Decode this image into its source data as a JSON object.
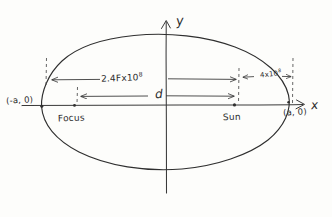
{
  "figure": {
    "type": "hand-drawn-geometry-sketch",
    "ink_color": "#333333",
    "paper_color": "#fdfdfb"
  },
  "axes": {
    "y_label": "y",
    "x_label": "x",
    "origin_x": 166,
    "origin_y": 105
  },
  "ellipse": {
    "center_x": 166,
    "center_y": 105,
    "semi_major_px": 126,
    "semi_minor_px": 72
  },
  "labels": {
    "left_vertex": "(-a, 0)",
    "right_vertex": "(a, 0)",
    "focus": "Focus",
    "sun": "Sun",
    "distance_d": "d",
    "major_distance_mantissa": "2.4",
    "major_distance_text": "2.4Fx10",
    "major_distance_exponent": "8",
    "minor_distance_text": "4x10",
    "minor_distance_exponent": "8"
  },
  "points": [
    {
      "name": "focus",
      "x": 74,
      "y": 105
    },
    {
      "name": "sun",
      "x": 234,
      "y": 105
    },
    {
      "name": "left-vertex",
      "x": 41,
      "y": 105
    },
    {
      "name": "right-vertex",
      "x": 289,
      "y": 105
    }
  ],
  "dimension_arrows": [
    {
      "name": "major-span",
      "label": "2.4Fx10^8",
      "from_x": 46,
      "to_x": 243,
      "y": 79
    },
    {
      "name": "minor-span",
      "label": "4x10^8",
      "from_x": 243,
      "to_x": 293,
      "y": 79
    },
    {
      "name": "d-span",
      "label": "d",
      "from_x": 77,
      "to_x": 238,
      "y": 96
    }
  ],
  "dashed_guides": [
    {
      "name": "guide-left-outer",
      "x": 46,
      "top": 58,
      "bottom": 86
    },
    {
      "name": "guide-focus",
      "x": 77,
      "top": 88,
      "bottom": 103
    },
    {
      "name": "guide-sun",
      "x": 239,
      "top": 70,
      "bottom": 103
    },
    {
      "name": "guide-right-outer",
      "x": 293,
      "top": 58,
      "bottom": 103
    }
  ]
}
